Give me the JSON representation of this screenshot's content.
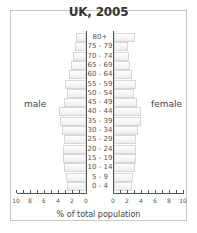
{
  "chart_data": {
    "type": "bar",
    "subtype": "population-pyramid",
    "title": "UK, 2005",
    "xlabel": "% of total population",
    "ylabel": "",
    "xlim": [
      0,
      10
    ],
    "x_ticks_left": [
      "10",
      "8",
      "6",
      "4",
      "2",
      "0"
    ],
    "x_ticks_right": [
      "0",
      "2",
      "4",
      "6",
      "8",
      "10"
    ],
    "grid": false,
    "legend": "none",
    "categories": [
      "80+",
      "75 - 79",
      "70 - 74",
      "65 - 69",
      "60 - 64",
      "55 - 59",
      "50 - 54",
      "45 - 49",
      "40 - 44",
      "35 - 39",
      "30 - 34",
      "25 - 29",
      "20 - 24",
      "15 - 19",
      "10 - 14",
      "5 - 9",
      "0 - 4"
    ],
    "series": [
      {
        "name": "male",
        "values": [
          1.5,
          1.6,
          1.9,
          2.2,
          2.5,
          3.0,
          2.7,
          3.2,
          3.8,
          3.7,
          3.4,
          3.1,
          3.3,
          3.3,
          3.1,
          2.8,
          2.7
        ]
      },
      {
        "name": "female",
        "values": [
          3.0,
          2.0,
          2.1,
          2.3,
          2.6,
          3.1,
          2.9,
          3.3,
          3.8,
          3.8,
          3.4,
          3.1,
          3.1,
          3.1,
          3.0,
          2.7,
          2.6
        ]
      }
    ],
    "side_labels": {
      "left": "male",
      "right": "female"
    }
  }
}
